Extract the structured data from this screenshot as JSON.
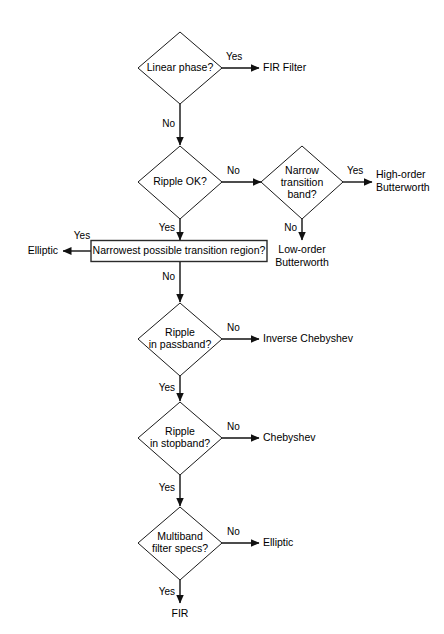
{
  "diagram": {
    "background_color": "#ffffff",
    "line_color": "#111111",
    "text_color": "#000000"
  },
  "decisions": {
    "linear_phase": "Linear phase?",
    "ripple_ok": "Ripple OK?",
    "narrow_transition_line1": "Narrow",
    "narrow_transition_line2": "transition",
    "narrow_transition_line3": "band?",
    "ripple_passband_line1": "Ripple",
    "ripple_passband_line2": "in passband?",
    "ripple_stopband_line1": "Ripple",
    "ripple_stopband_line2": "in stopband?",
    "multiband_line1": "Multiband",
    "multiband_line2": "filter specs?"
  },
  "process": {
    "narrowest_region": "Narrowest possible transition region?"
  },
  "terminals": {
    "fir_filter": "FIR Filter",
    "high_order_butterworth_line1": "High-order",
    "high_order_butterworth_line2": "Butterworth",
    "low_order_butterworth_line1": "Low-order",
    "low_order_butterworth_line2": "Butterworth",
    "elliptic_left": "Elliptic",
    "inverse_chebyshev": "Inverse Chebyshev",
    "chebyshev": "Chebyshev",
    "elliptic_right": "Elliptic",
    "fir": "FIR"
  },
  "edge_labels": {
    "linear_phase_yes": "Yes",
    "linear_phase_no": "No",
    "ripple_ok_no": "No",
    "ripple_ok_yes": "Yes",
    "narrow_transition_yes": "Yes",
    "narrow_transition_no": "No",
    "narrowest_yes": "Yes",
    "narrowest_no": "No",
    "ripple_passband_no": "No",
    "ripple_passband_yes": "Yes",
    "ripple_stopband_no": "No",
    "ripple_stopband_yes": "Yes",
    "multiband_no": "No",
    "multiband_yes": "Yes"
  }
}
